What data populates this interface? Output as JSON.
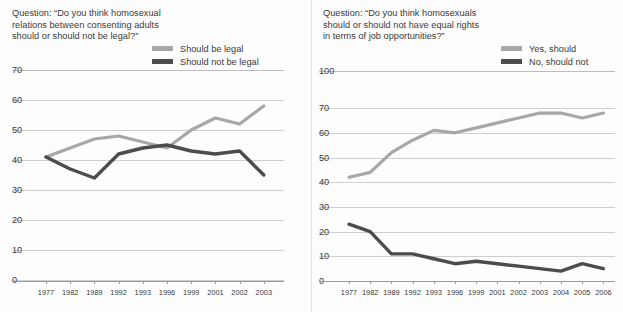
{
  "colors": {
    "series_light": "#a7a7a7",
    "series_dark": "#4c4c4c",
    "gridline": "#cfcfcf",
    "axis": "#9a9a9a",
    "text": "#3a3a3a",
    "background": "#fdfdfd"
  },
  "charts": [
    {
      "id": "legality-chart",
      "question": "Question: “Do you think homosexual relations between consenting adults should or should not be legal?”",
      "legend": [
        {
          "label": "Should be legal",
          "color": "#a7a7a7"
        },
        {
          "label": "Should not be legal",
          "color": "#4c4c4c"
        }
      ],
      "yticks": [
        "0",
        "10",
        "20",
        "30",
        "40",
        "50",
        "60",
        "70"
      ],
      "xticks": [
        "1977",
        "1982",
        "1989",
        "1992",
        "1993",
        "1996",
        "1999",
        "2001",
        "2002",
        "2003"
      ]
    },
    {
      "id": "job-rights-chart",
      "question": "Question: “Do you think homosexuals should or should not have equal rights in terms of job opportunities?”",
      "legend": [
        {
          "label": "Yes, should",
          "color": "#a7a7a7"
        },
        {
          "label": "No, should not",
          "color": "#4c4c4c"
        }
      ],
      "yticks": [
        "0",
        "10",
        "20",
        "30",
        "40",
        "50",
        "60",
        "70",
        "100"
      ],
      "xticks": [
        "1977",
        "1982",
        "1989",
        "1992",
        "1993",
        "1996",
        "1999",
        "2001",
        "2002",
        "2003",
        "2004",
        "2005",
        "2006"
      ]
    }
  ],
  "chart_data": [
    {
      "type": "line",
      "title": "Question: “Do you think homosexual relations between consenting adults should or should not be legal?”",
      "xlabel": "",
      "ylabel": "",
      "categories": [
        "1977",
        "1982",
        "1989",
        "1992",
        "1993",
        "1996",
        "1999",
        "2001",
        "2002",
        "2003"
      ],
      "ylim": [
        0,
        70
      ],
      "ytick_values": [
        0,
        10,
        20,
        30,
        40,
        50,
        60,
        70
      ],
      "y_scale": "linear",
      "grid": true,
      "legend_position": "top-right",
      "series": [
        {
          "name": "Should be legal",
          "color": "#a7a7a7",
          "values": [
            41,
            44,
            47,
            48,
            46,
            44,
            50,
            54,
            52,
            58
          ]
        },
        {
          "name": "Should not be legal",
          "color": "#4c4c4c",
          "values": [
            41,
            37,
            34,
            42,
            44,
            45,
            43,
            42,
            43,
            35
          ]
        }
      ]
    },
    {
      "type": "line",
      "title": "Question: “Do you think homosexuals should or should not have equal rights in terms of job opportunities?”",
      "xlabel": "",
      "ylabel": "",
      "categories": [
        "1977",
        "1982",
        "1989",
        "1992",
        "1993",
        "1996",
        "1999",
        "2001",
        "2002",
        "2003",
        "2004",
        "2005",
        "2006"
      ],
      "ylim": [
        0,
        100
      ],
      "ytick_values": [
        0,
        10,
        20,
        30,
        40,
        50,
        60,
        70,
        100
      ],
      "y_scale": "broken-axis-top",
      "grid": true,
      "legend_position": "top-right",
      "series": [
        {
          "name": "Yes, should",
          "color": "#a7a7a7",
          "values": [
            42,
            44,
            52,
            57,
            61,
            60,
            62,
            64,
            66,
            68,
            68,
            66,
            68
          ]
        },
        {
          "name": "No, should not",
          "color": "#4c4c4c",
          "values": [
            23,
            20,
            11,
            11,
            9,
            7,
            8,
            7,
            6,
            5,
            4,
            7,
            5
          ]
        }
      ]
    }
  ]
}
